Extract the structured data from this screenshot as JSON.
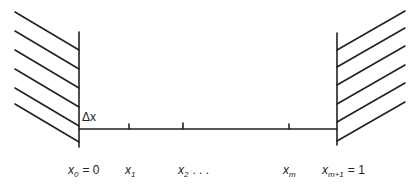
{
  "diagram": {
    "delta_label": "Δx",
    "labels": [
      {
        "var": "x",
        "sub": "0",
        "suffix": "= 0"
      },
      {
        "var": "x",
        "sub": "1",
        "suffix": ""
      },
      {
        "var": "x",
        "sub": "2",
        "suffix": ". . ."
      },
      {
        "var": "x",
        "sub": "m",
        "suffix": ""
      },
      {
        "var": "x",
        "sub": "m+1",
        "suffix": "= 1"
      }
    ],
    "stroke_color": "#222222"
  }
}
